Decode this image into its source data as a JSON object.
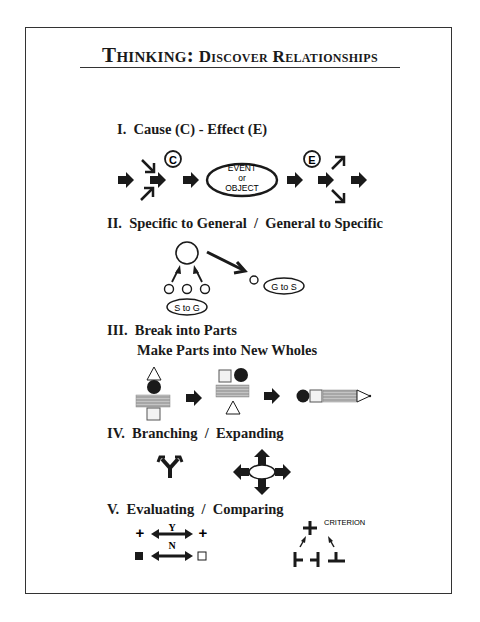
{
  "title": {
    "main": "Thinking:",
    "sub": "Discover Relationships"
  },
  "sections": [
    {
      "id": "I",
      "heading": "I.  Cause (C) - Effect (E)",
      "labels": {
        "cause": "C",
        "effect": "E",
        "event_line1": "EVENT",
        "event_line2": "or",
        "event_line3": "OBJECT"
      }
    },
    {
      "id": "II",
      "heading": "II.  Specific to General  /  General to Specific",
      "labels": {
        "s_to_g": "S to G",
        "g_to_s": "G to S"
      }
    },
    {
      "id": "III",
      "heading_line1": "III.  Break into Parts",
      "heading_line2": "Make Parts into New Wholes"
    },
    {
      "id": "IV",
      "heading": "IV.  Branching  /  Expanding"
    },
    {
      "id": "V",
      "heading": "V.  Evaluating  /  Comparing",
      "labels": {
        "yes": "Y",
        "no": "N",
        "criterion": "CRITERION"
      }
    }
  ],
  "colors": {
    "ink": "#1a1a1a",
    "border": "#333333",
    "hatch": "#9a9a9a",
    "background": "#ffffff"
  }
}
